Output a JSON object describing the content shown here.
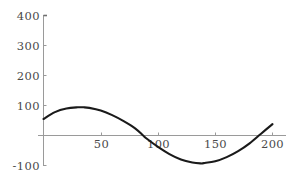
{
  "chart_data": {
    "type": "line",
    "title": "",
    "subtitle": "",
    "xlabel": "",
    "ylabel": "",
    "xlim": [
      0,
      203
    ],
    "ylim": [
      -110,
      400
    ],
    "grid": false,
    "legend": null,
    "axis_style": "crossed-axes-at-origin",
    "line_color": "#1a1a1a",
    "axis_color": "#9a9a9a",
    "tick_label_color": "#4a4a4a",
    "background_color": "#ffffff",
    "xticks": [
      50,
      100,
      150,
      200
    ],
    "xtick_labels": [
      "50",
      "100",
      "150",
      "200"
    ],
    "yticks": [
      400,
      300,
      200,
      100,
      -100
    ],
    "ytick_labels": [
      "400",
      "300",
      "200",
      "100",
      "-100"
    ],
    "x": [
      0,
      10,
      20,
      30,
      35,
      40,
      50,
      60,
      70,
      80,
      87,
      90,
      100,
      110,
      120,
      130,
      137,
      140,
      150,
      160,
      170,
      180,
      190,
      200
    ],
    "y": [
      55,
      78,
      90,
      94,
      94,
      92,
      83,
      68,
      48,
      24,
      0,
      -10,
      -38,
      -62,
      -80,
      -90,
      -93,
      -92,
      -86,
      -72,
      -52,
      -26,
      6,
      38
    ],
    "series": [
      {
        "name": "curve",
        "x": [
          0,
          10,
          20,
          30,
          35,
          40,
          50,
          60,
          70,
          80,
          87,
          90,
          100,
          110,
          120,
          130,
          137,
          140,
          150,
          160,
          170,
          180,
          190,
          200
        ],
        "values": [
          55,
          78,
          90,
          94,
          94,
          92,
          83,
          68,
          48,
          24,
          0,
          -10,
          -38,
          -62,
          -80,
          -90,
          -93,
          -92,
          -86,
          -72,
          -52,
          -26,
          6,
          38
        ]
      }
    ],
    "annotations": [],
    "features": {
      "left_endpoint_value": 55,
      "local_maximum": {
        "x": 33,
        "y": 94
      },
      "zero_crossing_descending": 87,
      "local_minimum": {
        "x": 137,
        "y": -93
      },
      "zero_crossing_ascending": 189,
      "right_endpoint_value": 38
    }
  }
}
